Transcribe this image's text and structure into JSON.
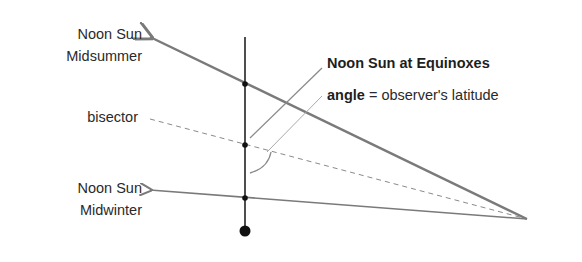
{
  "labels": {
    "midsummer_line1": "Noon Sun",
    "midsummer_line2": "Midsummer",
    "bisector": "bisector",
    "equinox_bold": "Noon Sun",
    "equinox_rest": " at Equinoxes",
    "angle_bold": "angle",
    "angle_rest": " = observer's latitude",
    "midwinter_line1": "Noon Sun",
    "midwinter_line2": "Midwinter"
  },
  "colors": {
    "lines": "#7a7a7a",
    "pole": "#222222",
    "background": "#ffffff"
  }
}
